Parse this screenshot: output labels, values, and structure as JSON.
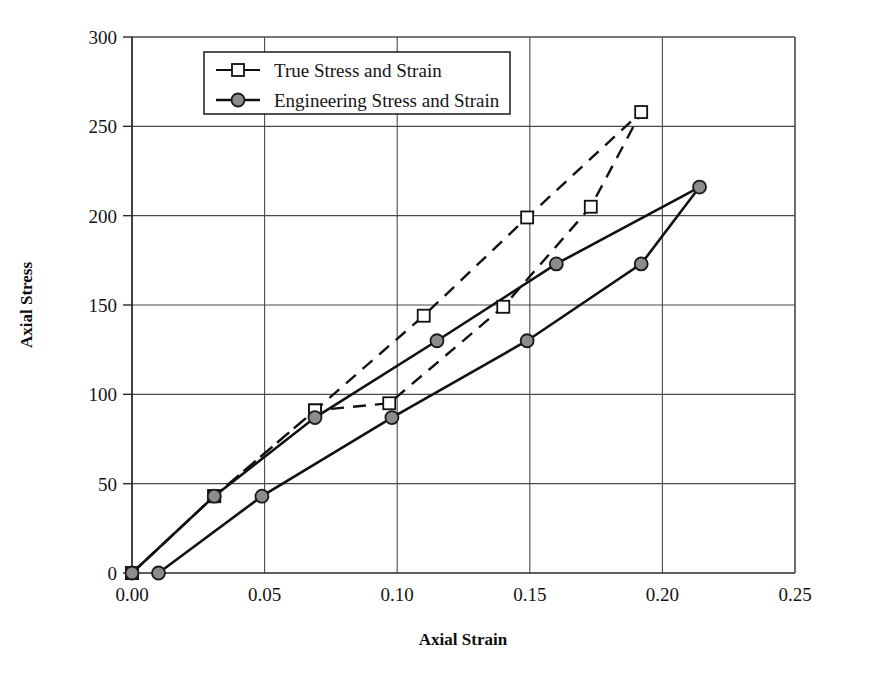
{
  "chart_data": {
    "type": "line",
    "title": "",
    "xlabel": "Axial Strain",
    "ylabel": "Axial Stress",
    "xlim": [
      0.0,
      0.25
    ],
    "ylim": [
      0,
      300
    ],
    "xticks": [
      "0.00",
      "0.05",
      "0.10",
      "0.15",
      "0.20",
      "0.25"
    ],
    "xtick_values": [
      0.0,
      0.05,
      0.1,
      0.15,
      0.2,
      0.25
    ],
    "yticks": [
      "0",
      "50",
      "100",
      "150",
      "200",
      "250",
      "300"
    ],
    "ytick_values": [
      0,
      50,
      100,
      150,
      200,
      250,
      300
    ],
    "grid": true,
    "legend_position": "top-center",
    "series": [
      {
        "name": "True Stress and Strain",
        "marker": "open-square",
        "line_style": "dashed",
        "color": "#111111",
        "points": [
          [
            0.0,
            0.0
          ],
          [
            0.031,
            43.0
          ],
          [
            0.069,
            91.0
          ],
          [
            0.11,
            144.0
          ],
          [
            0.149,
            199.0
          ],
          [
            0.192,
            258.0
          ],
          [
            0.173,
            205.0
          ],
          [
            0.14,
            149.0
          ],
          [
            0.097,
            95.0
          ],
          [
            0.069,
            91.0
          ],
          [
            0.031,
            43.0
          ],
          [
            0.0,
            0.0
          ]
        ]
      },
      {
        "name": "Engineering Stress and Strain",
        "marker": "filled-circle",
        "line_style": "solid",
        "color": "#111111",
        "points": [
          [
            0.01,
            0.0
          ],
          [
            0.049,
            43.0
          ],
          [
            0.098,
            87.0
          ],
          [
            0.149,
            130.0
          ],
          [
            0.192,
            173.0
          ],
          [
            0.214,
            216.0
          ],
          [
            0.16,
            173.0
          ],
          [
            0.115,
            130.0
          ],
          [
            0.069,
            87.0
          ],
          [
            0.031,
            43.0
          ],
          [
            0.0,
            0.0
          ]
        ]
      }
    ],
    "annotations": []
  },
  "legend": {
    "items": [
      {
        "label": "True Stress and Strain",
        "marker": "open-square",
        "style": "solid-with-marker"
      },
      {
        "label": "Engineering Stress and Strain",
        "marker": "filled-circle",
        "style": "solid-with-marker"
      }
    ]
  },
  "axes": {
    "x_title": "Axial Strain",
    "y_title": "Axial Stress"
  },
  "colors": {
    "line": "#111111",
    "grid": "#4a4a4a",
    "marker_fill_true": "#ffffff",
    "marker_fill_eng": "#8c8c8c",
    "background": "#ffffff"
  }
}
